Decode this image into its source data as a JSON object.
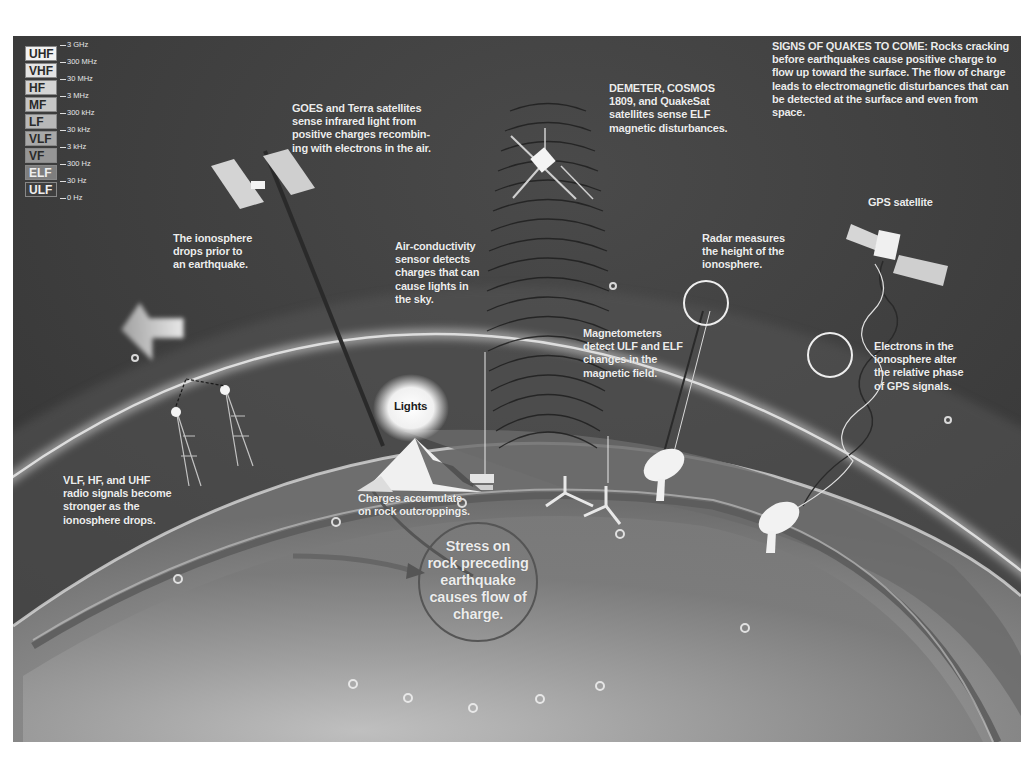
{
  "figure": {
    "title": "SIGNS OF QUAKES TO COME:",
    "intro_text": "Rocks cracking before earthquakes cause positive charge to flow up toward the surface. The flow of charge leads to electromagnetic disturbances that can be detected at the surface and even from space."
  },
  "legend": {
    "bands": [
      {
        "label": "UHF",
        "bg": "#f2f2f2",
        "fg": "#2a2a2a"
      },
      {
        "label": "VHF",
        "bg": "#e4e4e4",
        "fg": "#2a2a2a"
      },
      {
        "label": "HF",
        "bg": "#d4d4d4",
        "fg": "#2a2a2a"
      },
      {
        "label": "MF",
        "bg": "#c6c6c6",
        "fg": "#2a2a2a"
      },
      {
        "label": "LF",
        "bg": "#b8b8b8",
        "fg": "#2a2a2a"
      },
      {
        "label": "VLF",
        "bg": "#a8a8a8",
        "fg": "#2a2a2a"
      },
      {
        "label": "VF",
        "bg": "#969696",
        "fg": "#2a2a2a"
      },
      {
        "label": "ELF",
        "bg": "#7e7e7e",
        "fg": "#eeeeee"
      },
      {
        "label": "ULF",
        "bg": "#3f3f3f",
        "fg": "#eeeeee"
      }
    ],
    "frequencies": [
      "3 GHz",
      "300 MHz",
      "30 MHz",
      "3 MHz",
      "300 kHz",
      "30 kHz",
      "3 kHz",
      "300 Hz",
      "30 Hz",
      "0 Hz"
    ]
  },
  "labels": {
    "goes": "GOES and Terra satellites\nsense infrared light from\npositive charges recombin-\ning with electrons in the air.",
    "demeter": "DEMETER, COSMOS\n1809, and QuakeSat\nsatellites sense ELF\nmagnetic disturbances.",
    "gps_satellite": "GPS satellite",
    "ionosphere_drops": "The ionosphere\ndrops prior to\nan earthquake.",
    "air_conductivity": "Air-conductivity\nsensor detects\ncharges that can\ncause lights in\nthe sky.",
    "radar": "Radar measures\nthe height of the\nionosphere.",
    "magnetometers": "Magnetometers\ndetect ULF and ELF\nchanges in the\nmagnetic field.",
    "electrons": "Electrons in the\nionosphere alter\nthe relative phase\nof GPS signals.",
    "lights": "Lights",
    "radio_signals": "VLF, HF, and UHF\nradio signals become\nstronger as the\nionosphere drops.",
    "charges_accumulate": "Charges accumulate\non rock outcroppings.",
    "stress": "Stress on\nrock preceding\nearthquake\ncauses flow of\ncharge."
  },
  "colors": {
    "sky": "#3f3f3f",
    "ionosphere_glow": "#d8d8d8",
    "earth_surface": "#8a8a8a",
    "crust_band": "#6c6c6c",
    "interior": "#9a9a9a",
    "text": "#ececec"
  }
}
